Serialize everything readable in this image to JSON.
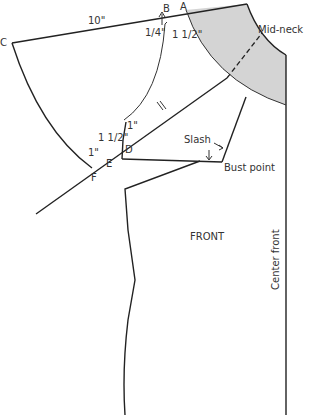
{
  "diagram": {
    "labels": {
      "top_measure": "10\"",
      "point_a": "A",
      "point_b": "B",
      "point_c": "C",
      "point_d": "D",
      "point_e": "E",
      "point_f": "F",
      "quarter_inch": "1/4\"",
      "one_half_a": "1 1/2\"",
      "one_half_b": "1 1/2\"",
      "one_inch_d": "1\"",
      "one_inch_f": "1\"",
      "mid_neck": "Mid-neck",
      "slash": "Slash",
      "bust_point": "Bust point",
      "front": "FRONT",
      "center_front": "Center front"
    },
    "colors": {
      "line": "#222222",
      "shade": "#d4d4d4",
      "text": "#333333"
    }
  }
}
